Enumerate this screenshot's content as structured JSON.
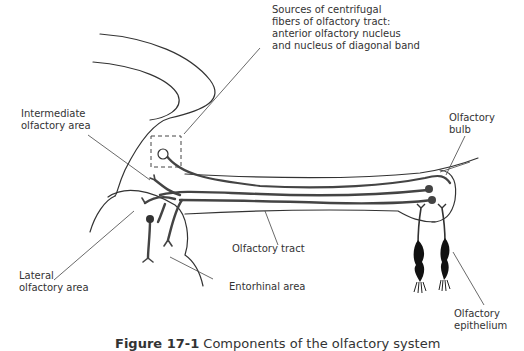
{
  "figure": {
    "caption_label": "Figure 17-1",
    "caption_text": " Components of the olfactory system"
  },
  "labels": {
    "centrifugal_sources": "Sources of centrifugal\nfibers of olfactory tract:\nanterior olfactory nucleus\nand nucleus of diagonal band",
    "intermediate_area": "Intermediate\nolfactory area",
    "olfactory_bulb": "Olfactory\nbulb",
    "lateral_area": "Lateral\nolfactory area",
    "olfactory_tract": "Olfactory tract",
    "entorhinal_area": "Entorhinal area",
    "olfactory_epithelium": "Olfactory\nepithelium"
  },
  "colors": {
    "outline": "#333333",
    "fiber": "#444444",
    "cell": "#111111",
    "text": "#333333"
  }
}
